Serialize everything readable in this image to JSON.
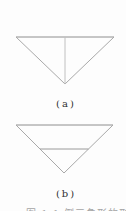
{
  "page": {
    "background": "#fdfdfd"
  },
  "figures": [
    {
      "id": "a",
      "label": "(a)",
      "description": "inverted triangle with vertical median from top edge midpoint to apex",
      "lines": [
        {
          "name": "triangle-a-top-edge",
          "x1": 16,
          "y1": 37,
          "x2": 114,
          "y2": 37,
          "color": "#8e8e8e"
        },
        {
          "name": "triangle-a-left-edge",
          "x1": 16,
          "y1": 37,
          "x2": 65,
          "y2": 84,
          "color": "#a9a9a9"
        },
        {
          "name": "triangle-a-right-edge",
          "x1": 114,
          "y1": 37,
          "x2": 65,
          "y2": 84,
          "color": "#a9a9a9"
        },
        {
          "name": "triangle-a-median",
          "x1": 65,
          "y1": 37,
          "x2": 65,
          "y2": 84,
          "color": "#c0c0c0"
        }
      ]
    },
    {
      "id": "b",
      "label": "(b)",
      "description": "inverted triangle with horizontal midsegment line",
      "lines": [
        {
          "name": "triangle-b-top-edge",
          "x1": 16,
          "y1": 125,
          "x2": 113,
          "y2": 125,
          "color": "#8e8e8e"
        },
        {
          "name": "triangle-b-left-edge",
          "x1": 16,
          "y1": 125,
          "x2": 64,
          "y2": 173,
          "color": "#a9a9a9"
        },
        {
          "name": "triangle-b-right-edge",
          "x1": 113,
          "y1": 125,
          "x2": 64,
          "y2": 173,
          "color": "#a9a9a9"
        },
        {
          "name": "triangle-b-midsegment",
          "x1": 40,
          "y1": 149,
          "x2": 88.5,
          "y2": 149,
          "color": "#9a9a9a"
        }
      ]
    }
  ],
  "caption": {
    "text": "图 1.1  倒三角形的形状"
  }
}
